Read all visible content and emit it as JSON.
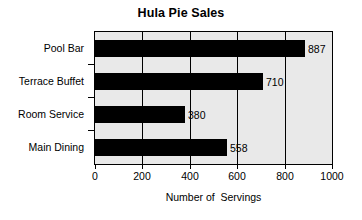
{
  "chart_data": {
    "type": "bar",
    "orientation": "horizontal",
    "title": "Hula Pie Sales",
    "xlabel": "Number of  Servings",
    "ylabel": "",
    "categories": [
      "Pool Bar",
      "Terrace Buffet",
      "Room Service",
      "Main Dining"
    ],
    "values": [
      887,
      710,
      380,
      558
    ],
    "data_labels": [
      "887",
      "710",
      "380",
      "558"
    ],
    "xlim": [
      0,
      1000
    ],
    "xticks": [
      0,
      200,
      400,
      600,
      800,
      1000
    ],
    "xtick_labels": [
      "0",
      "200",
      "400",
      "600",
      "800",
      "1000"
    ],
    "grid": true,
    "grid_axis": "x",
    "legend": false,
    "colors": {
      "bar": "#000000",
      "plot_background": "#e9e9e9",
      "page_background": "#ffffff",
      "axis": "#000000",
      "gridline": "#000000",
      "text": "#000000"
    }
  }
}
